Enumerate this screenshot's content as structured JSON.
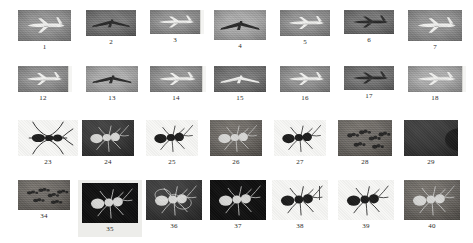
{
  "grid": {
    "rows": [
      {
        "row_id": "row-1",
        "category": "airplane",
        "top": 10,
        "thumb_height": 31,
        "items": [
          {
            "label": "1",
            "left": 18,
            "width": 53,
            "thumb_w": 53,
            "thumb_h": 31,
            "style": "sky",
            "subject": "airplane-landing-gear-down",
            "edge_strip": false,
            "selected": false
          },
          {
            "label": "2",
            "left": 86,
            "width": 50,
            "thumb_w": 50,
            "thumb_h": 26,
            "style": "sky-dark",
            "subject": "airplane-front-view",
            "edge_strip": false,
            "selected": false
          },
          {
            "label": "3",
            "left": 150,
            "width": 50,
            "thumb_w": 50,
            "thumb_h": 24,
            "style": "sky",
            "subject": "airplane-side-view",
            "edge_strip": true,
            "selected": false
          },
          {
            "label": "4",
            "left": 214,
            "width": 52,
            "thumb_w": 52,
            "thumb_h": 30,
            "style": "sky-light",
            "subject": "airplane-underside",
            "edge_strip": false,
            "selected": false
          },
          {
            "label": "5",
            "left": 280,
            "width": 50,
            "thumb_w": 50,
            "thumb_h": 26,
            "style": "sky",
            "subject": "airplane-banking",
            "edge_strip": false,
            "selected": false
          },
          {
            "label": "6",
            "left": 344,
            "width": 50,
            "thumb_w": 50,
            "thumb_h": 24,
            "style": "sky-dark",
            "subject": "airplane-distant",
            "edge_strip": false,
            "selected": false
          },
          {
            "label": "7",
            "left": 408,
            "width": 54,
            "thumb_w": 54,
            "thumb_h": 31,
            "style": "sky",
            "subject": "airplane-taxiing",
            "edge_strip": false,
            "selected": false
          }
        ]
      },
      {
        "row_id": "row-2",
        "category": "airplane",
        "top": 66,
        "thumb_height": 26,
        "items": [
          {
            "label": "12",
            "left": 18,
            "width": 50,
            "thumb_w": 50,
            "thumb_h": 26,
            "style": "sky",
            "subject": "airplane-in-flight",
            "edge_strip": true,
            "selected": false
          },
          {
            "label": "13",
            "left": 86,
            "width": 52,
            "thumb_w": 52,
            "thumb_h": 26,
            "style": "sky-light",
            "subject": "airplane-front-view",
            "edge_strip": false,
            "selected": false
          },
          {
            "label": "14",
            "left": 150,
            "width": 52,
            "thumb_w": 52,
            "thumb_h": 26,
            "style": "sky",
            "subject": "airplane-nose-left",
            "edge_strip": true,
            "selected": false
          },
          {
            "label": "15",
            "left": 214,
            "width": 52,
            "thumb_w": 52,
            "thumb_h": 26,
            "style": "sky-dark",
            "subject": "airplane-climbing",
            "edge_strip": false,
            "selected": false
          },
          {
            "label": "16",
            "left": 280,
            "width": 50,
            "thumb_w": 50,
            "thumb_h": 26,
            "style": "sky",
            "subject": "airplane-side-view",
            "edge_strip": false,
            "selected": false
          },
          {
            "label": "17",
            "left": 344,
            "width": 50,
            "thumb_w": 50,
            "thumb_h": 24,
            "style": "sky-dark",
            "subject": "airplane-over-terrain",
            "edge_strip": false,
            "selected": false
          },
          {
            "label": "18",
            "left": 408,
            "width": 54,
            "thumb_w": 54,
            "thumb_h": 26,
            "style": "sky-light",
            "subject": "airplane-landing",
            "edge_strip": true,
            "selected": false
          }
        ]
      },
      {
        "row_id": "row-3",
        "category": "ant",
        "top": 120,
        "thumb_height": 36,
        "items": [
          {
            "label": "23",
            "left": 18,
            "width": 60,
            "thumb_w": 60,
            "thumb_h": 36,
            "style": "paper-white",
            "subject": "ant-line-drawing-top-view",
            "edge_strip": false,
            "selected": false
          },
          {
            "label": "24",
            "left": 82,
            "width": 52,
            "thumb_w": 52,
            "thumb_h": 36,
            "style": "ground-dark",
            "subject": "ant-on-dark-surface",
            "edge_strip": false,
            "selected": false
          },
          {
            "label": "25",
            "left": 146,
            "width": 52,
            "thumb_w": 52,
            "thumb_h": 36,
            "style": "paper-white",
            "subject": "ant-specimen-white-bg",
            "edge_strip": false,
            "selected": false
          },
          {
            "label": "26",
            "left": 210,
            "width": 52,
            "thumb_w": 52,
            "thumb_h": 36,
            "style": "ground-mid",
            "subject": "ant-two-insects",
            "edge_strip": false,
            "selected": false
          },
          {
            "label": "27",
            "left": 274,
            "width": 52,
            "thumb_w": 52,
            "thumb_h": 36,
            "style": "paper-white",
            "subject": "ant-closeup-on-hand",
            "edge_strip": false,
            "selected": false
          },
          {
            "label": "28",
            "left": 338,
            "width": 54,
            "thumb_w": 54,
            "thumb_h": 36,
            "style": "ground-mid",
            "subject": "ant-colony-group",
            "edge_strip": false,
            "selected": false
          },
          {
            "label": "29",
            "left": 404,
            "width": 54,
            "thumb_w": 54,
            "thumb_h": 36,
            "style": "ground-dark",
            "subject": "ant-macro-head",
            "edge_strip": false,
            "selected": false
          }
        ]
      },
      {
        "row_id": "row-4",
        "category": "ant",
        "top": 180,
        "thumb_height": 40,
        "items": [
          {
            "label": "34",
            "left": 18,
            "width": 52,
            "thumb_w": 52,
            "thumb_h": 30,
            "style": "ground-mid",
            "subject": "ants-cluster",
            "edge_strip": false,
            "selected": false
          },
          {
            "label": "35",
            "left": 78,
            "width": 64,
            "thumb_w": 56,
            "thumb_h": 40,
            "style": "near-black",
            "subject": "ant-on-leaf",
            "edge_strip": false,
            "selected": true
          },
          {
            "label": "36",
            "left": 146,
            "width": 56,
            "thumb_w": 56,
            "thumb_h": 40,
            "style": "ground-dark",
            "subject": "ant-with-rings-overlay",
            "edge_strip": false,
            "selected": false
          },
          {
            "label": "37",
            "left": 210,
            "width": 56,
            "thumb_w": 56,
            "thumb_h": 40,
            "style": "near-black",
            "subject": "ant-backlit-dark",
            "edge_strip": false,
            "selected": false
          },
          {
            "label": "38",
            "left": 272,
            "width": 56,
            "thumb_w": 56,
            "thumb_h": 40,
            "style": "paper-white",
            "subject": "ant-illustration-scalebar",
            "edge_strip": false,
            "selected": false
          },
          {
            "label": "39",
            "left": 338,
            "width": 56,
            "thumb_w": 56,
            "thumb_h": 40,
            "style": "paper-white",
            "subject": "ant-profile-white-bg",
            "edge_strip": false,
            "selected": false
          },
          {
            "label": "40",
            "left": 404,
            "width": 56,
            "thumb_w": 56,
            "thumb_h": 40,
            "style": "ground-mid",
            "subject": "ant-on-wood",
            "edge_strip": false,
            "selected": false
          }
        ]
      }
    ]
  }
}
